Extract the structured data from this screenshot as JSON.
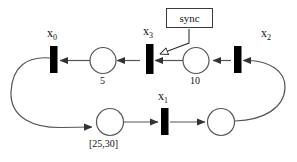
{
  "diagram": {
    "type": "petri-net",
    "title": "",
    "sync_annotation": {
      "label": "sync",
      "points_to": "x_3"
    },
    "transitions": [
      {
        "id": "x0",
        "label": "x",
        "sub": "0",
        "label_text": "x0"
      },
      {
        "id": "x3",
        "label": "x",
        "sub": "3",
        "label_text": "x3"
      },
      {
        "id": "x2",
        "label": "x",
        "sub": "2",
        "label_text": "x2"
      },
      {
        "id": "x1",
        "label": "x",
        "sub": "1",
        "label_text": "x1"
      }
    ],
    "places": [
      {
        "id": "p5",
        "label": "5"
      },
      {
        "id": "p10",
        "label": "10"
      },
      {
        "id": "p2530",
        "label": "[25,30]"
      },
      {
        "id": "p_empty",
        "label": ""
      }
    ],
    "colors": {
      "stroke": "#3a3a3a",
      "transition_fill": "#000000",
      "background": "#ffffff",
      "text": "#111111"
    }
  }
}
